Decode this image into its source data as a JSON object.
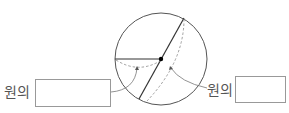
{
  "diagram": {
    "left_label": "원의",
    "right_label": "원의",
    "left_answer": "",
    "right_answer": "",
    "stroke_color": "#444444",
    "center_dot_color": "#000000"
  }
}
